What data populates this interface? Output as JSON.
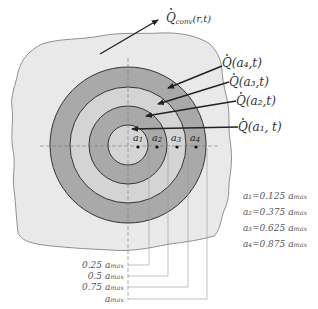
{
  "diagram": {
    "colors": {
      "background": "#ffffff",
      "blob_fill": "#e9e9e9",
      "blob_stroke": "#777777",
      "ring_dark": "#a9a9a9",
      "ring_light": "#d4d4d4",
      "ring_stroke": "#333333",
      "arrow": "#222222",
      "leader": "#999999"
    },
    "labels": {
      "q_conv": {
        "main": "Q",
        "sub": "conv",
        "args": "(r,t)"
      },
      "q_a4": {
        "main": "Q",
        "args": "(a₄,t)"
      },
      "q_a3": {
        "main": "Q",
        "args": "(a₃,t)"
      },
      "q_a2": {
        "main": "Q",
        "args": "(a₂,t)"
      },
      "q_a1": {
        "main": "Q",
        "args": "(a₁, t)"
      }
    },
    "ring_points": [
      {
        "label": "a1"
      },
      {
        "label": "a2"
      },
      {
        "label": "a3"
      },
      {
        "label": "a4"
      }
    ],
    "definitions": [
      {
        "text": "a₁=0.125 a",
        "sub": "max"
      },
      {
        "text": "a₂=0.375 a",
        "sub": "max"
      },
      {
        "text": "a₃=0.625 a",
        "sub": "max"
      },
      {
        "text": "a₄=0.875 a",
        "sub": "max"
      }
    ],
    "radius_markers": [
      {
        "text": "0.25 a",
        "sub": "max"
      },
      {
        "text": "0.5 a",
        "sub": "max"
      },
      {
        "text": "0.75 a",
        "sub": "max"
      },
      {
        "text": "a",
        "sub": "max"
      }
    ]
  }
}
